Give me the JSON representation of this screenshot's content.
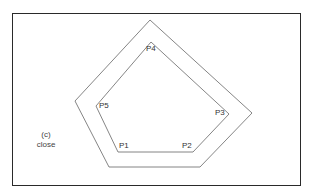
{
  "diagram": {
    "caption": {
      "label": "(c)",
      "text": "close"
    },
    "colors": {
      "frame": "#2a2a2a",
      "lines": "#666666",
      "text": "#333333",
      "background": "#ffffff"
    },
    "outer_polygon": {
      "points": "150,20 252,113 200,167 109,167 75,101"
    },
    "inner_polygon": {
      "points": "151,42 229,114 193,152 118,152 96,106"
    },
    "vertices": [
      {
        "label": "P1"
      },
      {
        "label": "P2"
      },
      {
        "label": "P3"
      },
      {
        "label": "P4"
      },
      {
        "label": "P5"
      }
    ]
  }
}
